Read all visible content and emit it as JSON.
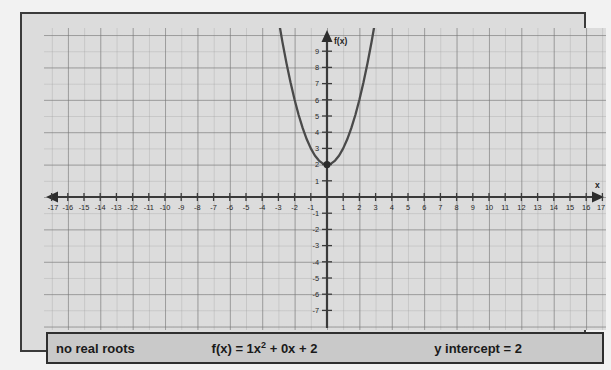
{
  "graph": {
    "y_axis_label": "f(x)",
    "x_axis_label": "x",
    "x_ticks": [
      -17,
      -16,
      -15,
      -14,
      -13,
      -12,
      -11,
      -10,
      -9,
      -8,
      -7,
      -6,
      -5,
      -4,
      -3,
      -2,
      -1,
      1,
      2,
      3,
      4,
      5,
      6,
      7,
      8,
      9,
      10,
      11,
      12,
      13,
      14,
      15,
      16,
      17
    ],
    "y_ticks": [
      9,
      8,
      7,
      6,
      5,
      4,
      3,
      2,
      1,
      -1,
      -2,
      -3,
      -4,
      -5,
      -6,
      -7
    ],
    "vertex_marker": {
      "x": 0,
      "y": 2
    }
  },
  "status": {
    "roots": "no real roots",
    "equation_prefix": "f(x) = 1x",
    "equation_exponent": "2",
    "equation_suffix": " + 0x + 2",
    "intercept": "y intercept = 2"
  },
  "colors": {
    "background": "#dcdcdc",
    "frame": "#3b3b3b",
    "curve": "#4a4a4a",
    "axis": "#3a3a3a",
    "status_bg": "#c9c9c9"
  },
  "chart_data": {
    "type": "line",
    "title": "",
    "xlabel": "x",
    "ylabel": "f(x)",
    "xlim": [
      -17,
      17
    ],
    "ylim": [
      -7.5,
      9.5
    ],
    "grid": true,
    "legend": "none",
    "equation": "f(x) = 1x^2 + 0x + 2",
    "coefficients": {
      "a": 1,
      "b": 0,
      "c": 2
    },
    "vertex": [
      0,
      2
    ],
    "y_intercept": 2,
    "real_roots": [],
    "roots_note": "no real roots",
    "xtick_labels": [
      "-17",
      "-16",
      "-15",
      "-14",
      "-13",
      "-12",
      "-11",
      "-10",
      "-9",
      "-8",
      "-7",
      "-6",
      "-5",
      "-4",
      "-3",
      "-2",
      "-1",
      "1",
      "2",
      "3",
      "4",
      "5",
      "6",
      "7",
      "8",
      "9",
      "10",
      "11",
      "12",
      "13",
      "14",
      "15",
      "16",
      "17"
    ],
    "ytick_labels": [
      "9",
      "8",
      "7",
      "6",
      "5",
      "4",
      "3",
      "2",
      "1",
      "-1",
      "-2",
      "-3",
      "-4",
      "-5",
      "-6",
      "-7"
    ],
    "series": [
      {
        "name": "f(x) = x^2 + 2",
        "x": [
          -3.2,
          -3.0,
          -2.75,
          -2.5,
          -2.25,
          -2.0,
          -1.75,
          -1.5,
          -1.25,
          -1.0,
          -0.75,
          -0.5,
          -0.25,
          0,
          0.25,
          0.5,
          0.75,
          1.0,
          1.25,
          1.5,
          1.75,
          2.0,
          2.25,
          2.5,
          2.75,
          3.0,
          3.2
        ],
        "y": [
          12.24,
          11.0,
          9.5625,
          8.25,
          7.0625,
          6.0,
          5.0625,
          4.25,
          3.5625,
          3.0,
          2.5625,
          2.25,
          2.0625,
          2.0,
          2.0625,
          2.25,
          2.5625,
          3.0,
          3.5625,
          4.25,
          5.0625,
          6.0,
          7.0625,
          8.25,
          9.5625,
          11.0,
          12.24
        ]
      }
    ]
  }
}
